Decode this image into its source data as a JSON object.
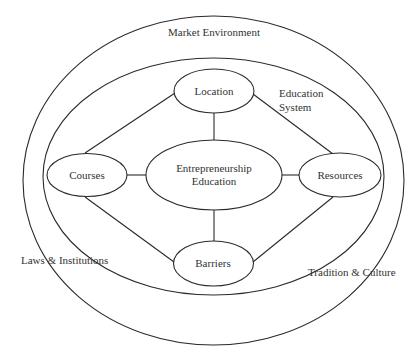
{
  "diagram": {
    "outer_ring": {
      "label": "Market Environment",
      "side_labels": [
        "Laws & Institutions",
        "Tradition & Culture"
      ]
    },
    "inner_ring": {
      "label_line1": "Education",
      "label_line2": "System"
    },
    "center": {
      "line1": "Entrepreneurship",
      "line2": "Education"
    },
    "nodes": {
      "top": "Location",
      "left": "Courses",
      "right": "Resources",
      "bottom": "Barriers"
    },
    "edges": [
      [
        "Location",
        "Entrepreneurship Education"
      ],
      [
        "Courses",
        "Entrepreneurship Education"
      ],
      [
        "Resources",
        "Entrepreneurship Education"
      ],
      [
        "Barriers",
        "Entrepreneurship Education"
      ],
      [
        "Location",
        "Courses"
      ],
      [
        "Location",
        "Resources"
      ],
      [
        "Courses",
        "Barriers"
      ],
      [
        "Resources",
        "Barriers"
      ]
    ],
    "colors": {
      "stroke": "#2a2a2a",
      "text": "#333333",
      "background": "#ffffff"
    }
  }
}
